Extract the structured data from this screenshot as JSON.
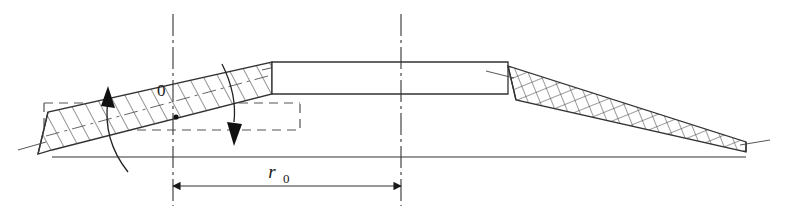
{
  "figure": {
    "background_color": "#ffffff",
    "line_color": "#333333",
    "hatch_color": "#3a3a3a",
    "dashed_color": "#444444",
    "arrow_color": "#111111",
    "width": 793,
    "height": 220
  },
  "labels": {
    "origin": "0",
    "radius_symbol": "r",
    "radius_subscript": "0"
  },
  "dimension": {
    "name": "r0",
    "display": "r₀",
    "from_axis": "center-axis-left",
    "to_axis": "center-axis-right",
    "x_start": 173,
    "x_end": 401,
    "y": 186,
    "arrow_style": "double-ended"
  },
  "axes": [
    {
      "name": "center-axis-left",
      "style": "chain-dash",
      "x": 173,
      "y_top": 14,
      "y_bottom": 206
    },
    {
      "name": "center-axis-right",
      "style": "chain-dash",
      "x": 401,
      "y_top": 14,
      "y_bottom": 206
    }
  ],
  "parts": [
    {
      "name": "left-blade-twisted",
      "hatch": "diagonal",
      "description": "Rotated blade section shown with single diagonal hatching"
    },
    {
      "name": "center-hub",
      "hatch": "none",
      "description": "Flat un-hatched central hub outline"
    },
    {
      "name": "right-blade",
      "hatch": "cross",
      "description": "Right blade section shown with cross hatching"
    },
    {
      "name": "reference-rectangle",
      "hatch": "none",
      "description": "Dashed rectangle marking the untwisted reference position"
    }
  ],
  "arrows": [
    {
      "name": "rotation-arrow-up",
      "direction": "up",
      "description": "Curved rotation indicator pointing upward at left"
    },
    {
      "name": "rotation-arrow-down",
      "direction": "down",
      "description": "Curved rotation indicator pointing downward at right of twist"
    }
  ]
}
